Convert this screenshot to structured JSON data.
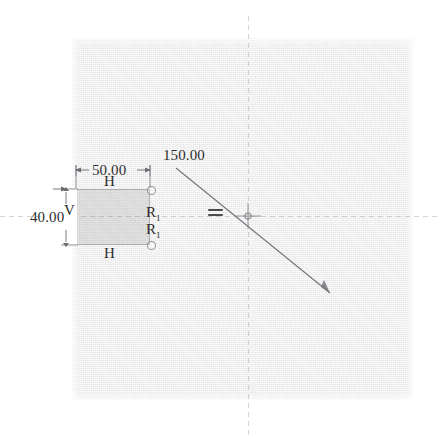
{
  "app": {
    "kind": "cad-sketch-viewport",
    "background_color": "#ffffff",
    "canvas_color": "#eaeaea",
    "geometry_color": "#6e6e76",
    "text_color": "#2e2e2e"
  },
  "canvas": {
    "name": "sketch-canvas",
    "x": 72,
    "y": 38,
    "width": 341,
    "height": 362
  },
  "centerlines": {
    "vertical_x": 248,
    "horizontal_y": 216,
    "style": "dashed"
  },
  "origin": {
    "label": "origin-point",
    "x": 248,
    "y": 216
  },
  "shapes": {
    "rectangle": {
      "name": "sketch-rectangle",
      "x": 76,
      "y": 189,
      "width": 74,
      "height": 56
    },
    "diagonal_line": {
      "name": "sketch-diagonal-line",
      "x1": 176,
      "y1": 168,
      "x2": 330,
      "y2": 293
    }
  },
  "dimensions": [
    {
      "id": "width-dimension",
      "value": "50.00",
      "type": "horizontal",
      "x": 92,
      "y": 163
    },
    {
      "id": "height-dimension",
      "value": "40.00",
      "type": "vertical",
      "x": 30,
      "y": 210
    },
    {
      "id": "length-dimension",
      "value": "150.00",
      "type": "aligned",
      "x": 163,
      "y": 148
    }
  ],
  "constraints": [
    {
      "id": "horizontal-constraint-top",
      "glyph": "H",
      "subscript": "",
      "x": 104,
      "y": 174
    },
    {
      "id": "horizontal-constraint-bottom",
      "glyph": "H",
      "subscript": "",
      "x": 104,
      "y": 246
    },
    {
      "id": "vertical-constraint-left",
      "glyph": "V",
      "subscript": "",
      "x": 64,
      "y": 203
    },
    {
      "id": "radius-constraint-upper",
      "glyph": "R",
      "subscript": "1",
      "x": 146,
      "y": 205
    },
    {
      "id": "radius-constraint-lower",
      "glyph": "R",
      "subscript": "1",
      "x": 146,
      "y": 222
    },
    {
      "id": "equal-constraint",
      "glyph": "=",
      "subscript": "",
      "x": 208,
      "y": 209
    }
  ],
  "point_markers": [
    {
      "id": "corner-point-top-right",
      "x": 150,
      "y": 189
    },
    {
      "id": "corner-point-bottom-right",
      "x": 150,
      "y": 245
    }
  ]
}
